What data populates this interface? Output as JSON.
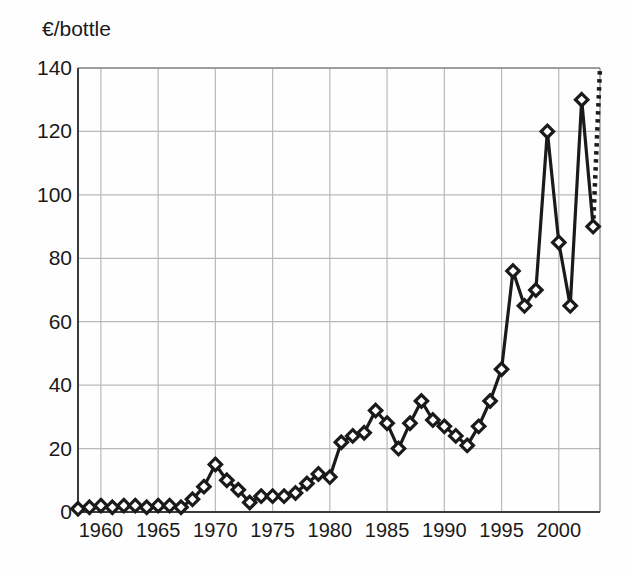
{
  "chart_data": {
    "type": "line",
    "title": "",
    "subtitle": "",
    "ylabel": "€/bottle",
    "xlabel": "",
    "ylim": [
      0,
      140
    ],
    "xlim": [
      1958,
      2003.6
    ],
    "yticks": [
      0,
      20,
      40,
      60,
      80,
      100,
      120,
      140
    ],
    "xticks": [
      1960,
      1965,
      1970,
      1975,
      1980,
      1985,
      1990,
      1995,
      2000
    ],
    "xtick_labels": [
      "1960",
      "1965",
      "1970",
      "1975",
      "1980",
      "1985",
      "1990",
      "1995",
      "2000"
    ],
    "ytick_labels": [
      "0",
      "20",
      "40",
      "60",
      "80",
      "100",
      "120",
      "140"
    ],
    "grid": true,
    "grid_color": "#b9b9b9",
    "legend": "none",
    "marker": "diamond",
    "line_color": "#1a1a1a",
    "marker_fill": "#ffffff",
    "marker_edge": "#1a1a1a",
    "x": [
      1958,
      1959,
      1960,
      1961,
      1962,
      1963,
      1964,
      1965,
      1966,
      1967,
      1968,
      1969,
      1970,
      1971,
      1972,
      1973,
      1974,
      1975,
      1976,
      1977,
      1978,
      1979,
      1980,
      1981,
      1982,
      1983,
      1984,
      1985,
      1986,
      1987,
      1988,
      1989,
      1990,
      1991,
      1992,
      1993,
      1994,
      1995,
      1996,
      1997,
      1998,
      1999,
      2000,
      2001,
      2002,
      2003
    ],
    "values": [
      1,
      1.5,
      2,
      1.5,
      2,
      2,
      1.5,
      2,
      2,
      1.5,
      4,
      8,
      15,
      10,
      7,
      3,
      5,
      5,
      5,
      6,
      9,
      12,
      11,
      22,
      24,
      25,
      32,
      28,
      20,
      28,
      35,
      29,
      27,
      24,
      21,
      27,
      35,
      45,
      76,
      65,
      70,
      120,
      85,
      65,
      130,
      90
    ],
    "forecast": {
      "style": "dotted",
      "x": [
        2003,
        2003.6
      ],
      "values": [
        90,
        140
      ],
      "color": "#1a1a1a"
    }
  },
  "axis_title_text": "€/bottle"
}
